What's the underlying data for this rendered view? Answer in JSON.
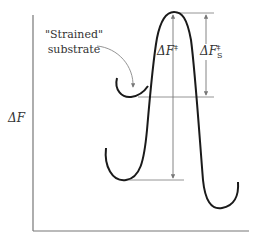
{
  "diagram": {
    "y_axis_label": "ΔF",
    "strained_label_line1": "\"Strained\"",
    "strained_label_line2": "substrate",
    "delta_f_label": "ΔF",
    "delta_f_sup": "‡",
    "delta_fs_label": "ΔF",
    "delta_fs_sub": "S",
    "delta_fs_sup": "‡",
    "colors": {
      "curve": "#1a1a1a",
      "guide": "#888888",
      "axis": "#777777",
      "text": "#333333"
    }
  }
}
